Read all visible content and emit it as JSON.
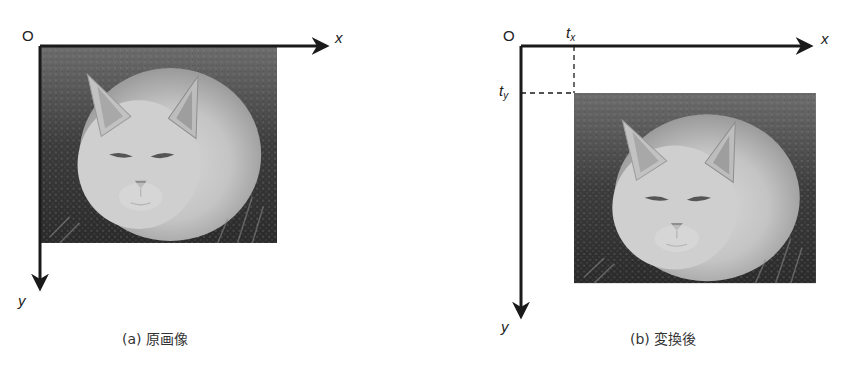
{
  "figure": {
    "panels": [
      {
        "id": "a",
        "origin_label": "O",
        "x_axis_label": "x",
        "y_axis_label": "y",
        "caption": "(a) 原画像",
        "image": "cat-photo-original"
      },
      {
        "id": "b",
        "origin_label": "O",
        "x_axis_label": "x",
        "y_axis_label": "y",
        "tx_label": "t",
        "tx_sub": "x",
        "ty_label": "t",
        "ty_sub": "y",
        "caption": "(b) 変換後",
        "image": "cat-photo-translated"
      }
    ]
  },
  "colors": {
    "axis": "#1a1a1a",
    "background": "#ffffff"
  }
}
